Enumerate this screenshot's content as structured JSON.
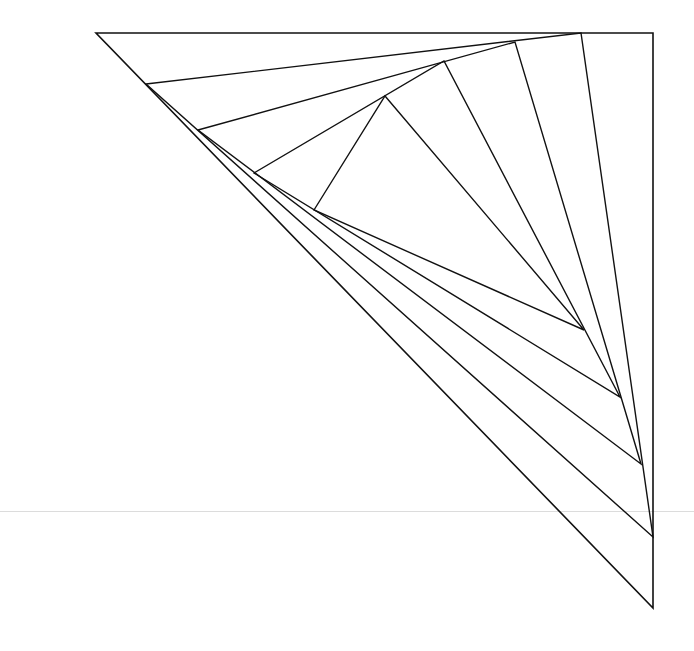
{
  "diagram": {
    "title": "",
    "stroke_color": "#111111",
    "background": "#ffffff",
    "guide_line": {
      "y": 511,
      "color": "#dcdcdc"
    },
    "triangles": [
      {
        "name": "outer",
        "points": [
          [
            96,
            33
          ],
          [
            653,
            33
          ],
          [
            653,
            608
          ]
        ]
      },
      {
        "name": "level-1",
        "points": [
          [
            146,
            84
          ],
          [
            581,
            33
          ],
          [
            653,
            537
          ]
        ]
      },
      {
        "name": "level-2",
        "points": [
          [
            198,
            130
          ],
          [
            515,
            42
          ],
          [
            641,
            464
          ]
        ]
      },
      {
        "name": "level-3",
        "points": [
          [
            254,
            173
          ],
          [
            444,
            61
          ],
          [
            620,
            397
          ]
        ]
      },
      {
        "name": "level-4",
        "points": [
          [
            314,
            210
          ],
          [
            385,
            96
          ],
          [
            584,
            330
          ]
        ]
      }
    ]
  }
}
